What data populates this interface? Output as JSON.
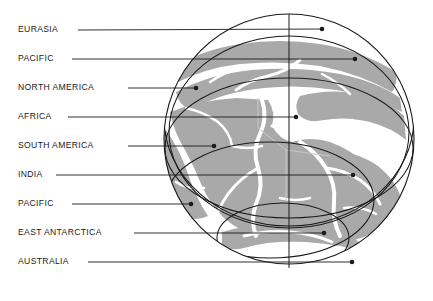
{
  "figure": {
    "name": "earth-cutaway-globe-diagram",
    "background_color": "#ffffff",
    "land_color": "#a9a9a9",
    "ocean_color": "#ffffff",
    "line_color": "#1a1a1a",
    "label_color": "#1a1a1a",
    "globe": {
      "center_x": 289,
      "center_y": 139,
      "radius": 125,
      "meridian_x": 289
    }
  },
  "labels": [
    {
      "id": "eurasia",
      "text": "EURASIA",
      "text_x": 18,
      "text_y": 30,
      "leader_start_x": 78,
      "leader_end_x": 322,
      "dot_x": 322,
      "dot_y": 29
    },
    {
      "id": "pacific-north",
      "text": "PACIFIC",
      "text_x": 18,
      "text_y": 59,
      "leader_start_x": 72,
      "leader_end_x": 355,
      "dot_x": 355,
      "dot_y": 59
    },
    {
      "id": "north-america",
      "text": "NORTH AMERICA",
      "text_x": 18,
      "text_y": 88,
      "leader_start_x": 128,
      "leader_end_x": 196,
      "dot_x": 196,
      "dot_y": 88
    },
    {
      "id": "africa",
      "text": "AFRICA",
      "text_x": 18,
      "text_y": 117,
      "leader_start_x": 68,
      "leader_end_x": 296,
      "dot_x": 296,
      "dot_y": 117
    },
    {
      "id": "south-america",
      "text": "SOUTH AMERICA",
      "text_x": 18,
      "text_y": 146,
      "leader_start_x": 128,
      "leader_end_x": 214,
      "dot_x": 214,
      "dot_y": 146
    },
    {
      "id": "india",
      "text": "INDIA",
      "text_x": 18,
      "text_y": 175,
      "leader_start_x": 56,
      "leader_end_x": 353,
      "dot_x": 353,
      "dot_y": 175
    },
    {
      "id": "pacific-south",
      "text": "PACIFIC",
      "text_x": 18,
      "text_y": 204,
      "leader_start_x": 72,
      "leader_end_x": 191,
      "dot_x": 191,
      "dot_y": 204
    },
    {
      "id": "east-antarctica",
      "text": "EAST ANTARCTICA",
      "text_x": 18,
      "text_y": 233,
      "leader_start_x": 134,
      "leader_end_x": 324,
      "dot_x": 324,
      "dot_y": 233
    },
    {
      "id": "australia",
      "text": "AUSTRALIA",
      "text_x": 18,
      "text_y": 262,
      "leader_start_x": 88,
      "leader_end_x": 352,
      "dot_x": 352,
      "dot_y": 262
    }
  ],
  "overlay_ellipses": [
    {
      "id": "shell-outer-upper",
      "cx": 289,
      "cy": 118,
      "rx": 125,
      "ry": 108,
      "rotate": 0
    },
    {
      "id": "shell-mid-upper",
      "cx": 289,
      "cy": 132,
      "rx": 120,
      "ry": 96,
      "rotate": 0
    },
    {
      "id": "shell-equator",
      "cx": 289,
      "cy": 148,
      "rx": 124,
      "ry": 70,
      "rotate": 0
    },
    {
      "id": "shell-lower",
      "cx": 270,
      "cy": 200,
      "rx": 104,
      "ry": 58,
      "rotate": 0
    },
    {
      "id": "shell-inner",
      "cx": 283,
      "cy": 238,
      "rx": 66,
      "ry": 35,
      "rotate": 0
    }
  ],
  "meridians": [
    {
      "id": "meridian-vertical",
      "x1": 289,
      "y1": 14,
      "x2": 289,
      "y2": 268
    }
  ]
}
